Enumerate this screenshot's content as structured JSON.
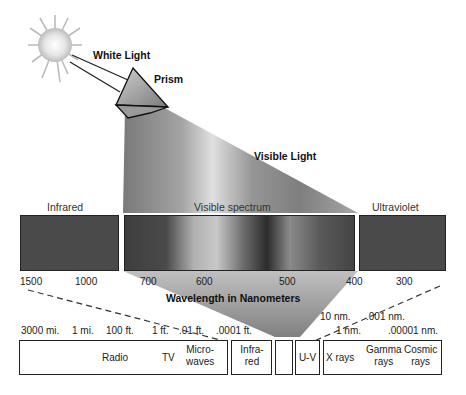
{
  "title_labels": {
    "white_light": "White Light",
    "prism": "Prism",
    "visible_light": "Visible Light",
    "wavelength_axis": "Wavelength in Nanometers"
  },
  "spectrum_bands": {
    "infrared": "Infrared",
    "visible": "Visible spectrum",
    "ultraviolet": "Ultraviolet"
  },
  "nm_ticks": [
    "1500",
    "1000",
    "700",
    "600",
    "500",
    "400",
    "300"
  ],
  "em_scale_ticks_top": [
    "10 nm.",
    ".001 nm."
  ],
  "em_scale_ticks": [
    "3000 mi.",
    "1 mi.",
    "100 ft.",
    "1 ft.",
    ".01 ft.",
    ".0001 ft.",
    "1 nm.",
    ".00001 nm."
  ],
  "em_bands": {
    "radio": "Radio",
    "tv": "TV",
    "microwaves_1": "Micro-",
    "microwaves_2": "waves",
    "infrared_1": "Infra-",
    "infrared_2": "red",
    "visible": "",
    "uv": "U-V",
    "xrays": "X rays",
    "gamma_1": "Gamma",
    "gamma_2": "rays",
    "cosmic_1": "Cosmic",
    "cosmic_2": "rays"
  },
  "colors": {
    "band_fill": "#4a4a4a",
    "beam_dark": "#5a5a5a",
    "beam_light": "#d8d8d8",
    "outline": "#222222"
  }
}
